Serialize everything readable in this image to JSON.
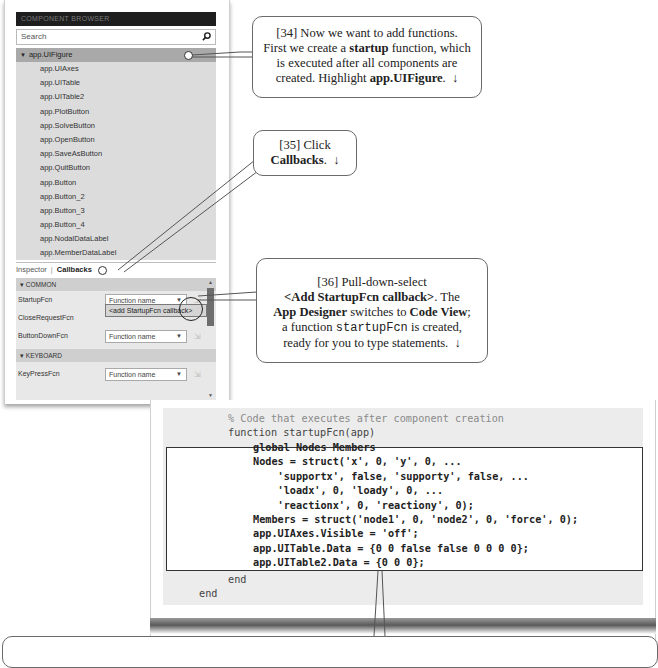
{
  "component_browser": {
    "header": "COMPONENT BROWSER",
    "search_placeholder": "Search",
    "search_icon": "magnifier-icon",
    "root": {
      "label": "app.UIFigure",
      "expanded": true,
      "selected": true
    },
    "children": [
      "app.UIAxes",
      "app.UITable",
      "app.UITable2",
      "app.PlotButton",
      "app.SolveButton",
      "app.OpenButton",
      "app.SaveAsButton",
      "app.QuitButton",
      "app.Button",
      "app.Button_2",
      "app.Button_3",
      "app.Button_4",
      "app.NodalDataLabel",
      "app.MemberDataLabel"
    ]
  },
  "inspector_tabs": {
    "inspector": "Inspector",
    "separator": "|",
    "callbacks": "Callbacks",
    "active": "Callbacks"
  },
  "callbacks": {
    "sections": [
      {
        "title": "COMMON",
        "rows": [
          {
            "label": "StartupFcn",
            "value": "Function name"
          },
          {
            "label": "CloseRequestFcn",
            "value": "Function name"
          },
          {
            "label": "ButtonDownFcn",
            "value": "Function name"
          }
        ]
      },
      {
        "title": "KEYBOARD",
        "rows": [
          {
            "label": "KeyPressFcn",
            "value": "Function name"
          }
        ]
      }
    ],
    "open_dropdown_option": "<add StartupFcn callback>",
    "goto_icon": "goto-callback-icon"
  },
  "callouts": {
    "c34": {
      "num": "[34]",
      "t1": " Now we want to add functions.",
      "t2": "First we create a ",
      "t2b": "startup",
      "t3": " function, which",
      "t4": "is executed after all components are",
      "t5": "created.  Highlight ",
      "t5b": "app.UIFigure",
      "t6": ".",
      "arrow": "↓"
    },
    "c35": {
      "num": "[35]",
      "t1": " Click",
      "t2b": "Callbacks",
      "t3": ".",
      "arrow": "↓"
    },
    "c36": {
      "num": "[36]",
      "t1": " Pull-down-select",
      "t2b": "<Add StartupFcn callback>",
      "t3": ".  The",
      "t4b": "App Designer",
      "t5": " switches to ",
      "t5b": "Code View",
      "t6": ";",
      "t7": "a function ",
      "t7m": "startupFcn",
      "t8": " is created,",
      "t9": "ready for you to type statements.",
      "arrow": "↓"
    }
  },
  "code_view": {
    "comment": "% Code that executes after component creation",
    "signature": "function startupFcn(app)",
    "body": [
      "global Nodes Members",
      "Nodes = struct('x', 0, 'y', 0, ...",
      "    'supportx', false, 'supporty', false, ...",
      "    'loadx', 0, 'loady', 0, ...",
      "    'reactionx', 0, 'reactiony', 0);",
      "Members = struct('node1', 0, 'node2', 0, 'force', 0);",
      "app.UIAxes.Visible = 'off';",
      "app.UITable.Data = {0 0 false false 0 0 0 0};",
      "app.UITable2.Data = {0 0 0};"
    ],
    "end_inner": "end",
    "end_outer": "end"
  }
}
